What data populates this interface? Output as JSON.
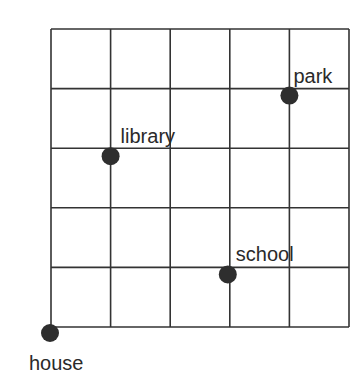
{
  "diagram": {
    "type": "grid-map",
    "grid": {
      "columns": 5,
      "rows": 5,
      "origin_px": [
        51,
        327
      ],
      "cell_px": 59.6,
      "line_color": "#333333"
    },
    "dot_color": "#2e2e2e",
    "points": [
      {
        "name": "house",
        "label": "house",
        "col": 0,
        "row": 0,
        "label_dx": -21,
        "label_dy": 20
      },
      {
        "name": "library",
        "label": "library",
        "col": 1,
        "row": 3,
        "label_dx": 10,
        "label_dy": -30
      },
      {
        "name": "park",
        "label": "park",
        "col": 4,
        "row": 4,
        "label_dx": 4,
        "label_dy": -30
      },
      {
        "name": "school",
        "label": "school",
        "col": 3,
        "row": 1,
        "label_dx": 8,
        "label_dy": -30
      }
    ]
  }
}
